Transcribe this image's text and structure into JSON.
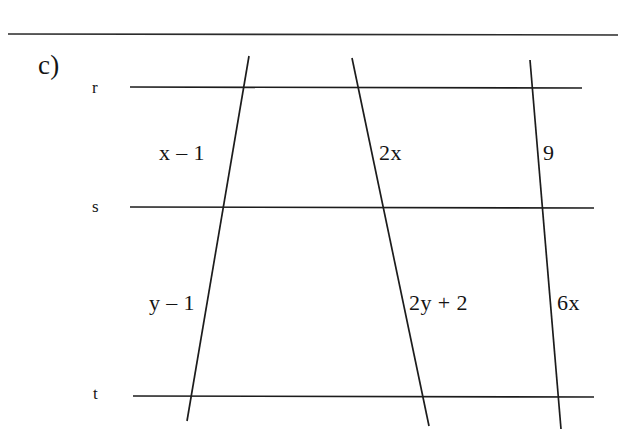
{
  "figure": {
    "problem_label": "c)",
    "ink_color": "#141414",
    "background_color": "#ffffff",
    "top_rule": {
      "name": "page-divider-rule",
      "x1": 8,
      "y1": 34,
      "x2": 618,
      "y2": 35
    },
    "parallel_lines": [
      {
        "id": "r",
        "label": "r",
        "label_x": 92,
        "label_y": 79,
        "x1": 130,
        "y1": 87,
        "x2": 582,
        "y2": 88
      },
      {
        "id": "s",
        "label": "s",
        "label_x": 92,
        "label_y": 198,
        "x1": 130,
        "y1": 207,
        "x2": 594,
        "y2": 208
      },
      {
        "id": "t",
        "label": "t",
        "label_x": 93,
        "label_y": 385,
        "x1": 133,
        "y1": 396,
        "x2": 594,
        "y2": 397
      }
    ],
    "transversals": [
      {
        "id": "transversal-left",
        "x1": 249,
        "y1": 56,
        "x2": 187,
        "y2": 421
      },
      {
        "id": "transversal-middle",
        "x1": 352,
        "y1": 58,
        "x2": 429,
        "y2": 426
      },
      {
        "id": "transversal-right",
        "x1": 530,
        "y1": 60,
        "x2": 561,
        "y2": 429
      }
    ],
    "segment_labels": [
      {
        "id": "seg-left-upper",
        "text": "x – 1",
        "x": 159,
        "y": 142
      },
      {
        "id": "seg-middle-upper",
        "text": "2x",
        "x": 379,
        "y": 142
      },
      {
        "id": "seg-right-upper",
        "text": "9",
        "x": 543,
        "y": 142
      },
      {
        "id": "seg-left-lower",
        "text": "y – 1",
        "x": 149,
        "y": 292
      },
      {
        "id": "seg-middle-lower",
        "text": "2y + 2",
        "x": 409,
        "y": 292
      },
      {
        "id": "seg-right-lower",
        "text": "6x",
        "x": 557,
        "y": 292
      }
    ]
  }
}
